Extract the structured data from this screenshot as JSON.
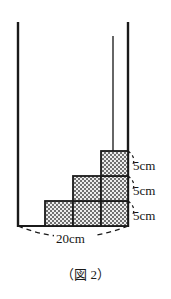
{
  "figure": {
    "caption": "（図 2）",
    "alt_name": "stepped-blocks-in-container",
    "colors": {
      "ink": "#1a1a1a",
      "fill_light": "#e8e8e8",
      "fill_dark": "#6b6b6b",
      "background": "#ffffff"
    },
    "container": {
      "left_wall_x": 18,
      "right_wall_x": 128,
      "inner_line_x": 113,
      "base_y": 226,
      "top_y": 22,
      "inner_line_top_y": 36
    },
    "base_dimension": {
      "label": "20cm",
      "value": 20,
      "unit": "cm"
    },
    "height_dimensions": [
      {
        "label": "5cm",
        "value": 5,
        "unit": "cm",
        "row": "top"
      },
      {
        "label": "5cm",
        "value": 5,
        "unit": "cm",
        "row": "middle"
      },
      {
        "label": "5cm",
        "value": 5,
        "unit": "cm",
        "row": "bottom"
      }
    ],
    "blocks": {
      "rows": 3,
      "counts_per_row": [
        3,
        2,
        1
      ],
      "total": 6,
      "cell_width": 28,
      "cell_height": 25
    }
  }
}
